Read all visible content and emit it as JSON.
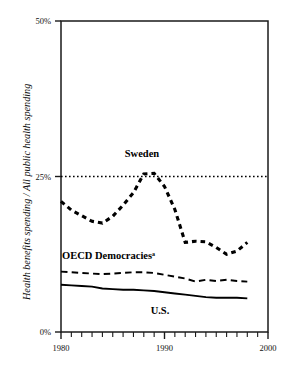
{
  "chart_data": {
    "type": "line",
    "title": "",
    "subtitle": "",
    "xlabel": "",
    "ylabel": "Health benefits spending / All public health spending",
    "xlim": [
      1980,
      2000
    ],
    "ylim": [
      0,
      50
    ],
    "ytick_labels": [
      "0%",
      "25%",
      "50%"
    ],
    "ytick_values": [
      0,
      25,
      50
    ],
    "xtick_labels": [
      "1980",
      "1990",
      "2000"
    ],
    "xtick_values": [
      1980,
      1990,
      2000
    ],
    "xtick_minor_step": 1,
    "grid": false,
    "legend_position": "inline-annotations",
    "reference_lines": [
      {
        "name": "twenty-five-percent-line",
        "y": 25,
        "style": "dotted"
      }
    ],
    "annotations": [
      {
        "name": "sweden-label",
        "text": "Sweden",
        "x": 1988.0,
        "y": 29.5
      },
      {
        "name": "oecd-label",
        "text": "OECD Democracies",
        "superscript": "a",
        "x": 1985.0,
        "y": 12.9
      },
      {
        "name": "us-label",
        "text": "U.S.",
        "x": 1991.5,
        "y": 3.3
      }
    ],
    "series": [
      {
        "name": "Sweden",
        "style": "heavy-dashed",
        "x": [
          1980,
          1981,
          1982,
          1983,
          1984,
          1985,
          1986,
          1987,
          1988,
          1989,
          1990,
          1991,
          1992,
          1993,
          1994,
          1995,
          1996,
          1997,
          1998
        ],
        "values": [
          21.0,
          19.6,
          18.7,
          17.8,
          17.5,
          18.6,
          20.4,
          22.4,
          25.4,
          25.5,
          23.4,
          19.7,
          14.4,
          14.6,
          14.5,
          13.6,
          12.5,
          13.0,
          14.4
        ]
      },
      {
        "name": "OECD Democracies",
        "style": "medium-dashed",
        "x": [
          1980,
          1981,
          1982,
          1983,
          1984,
          1985,
          1986,
          1987,
          1988,
          1989,
          1990,
          1991,
          1992,
          1993,
          1994,
          1995,
          1996,
          1997,
          1998
        ],
        "values": [
          9.7,
          9.6,
          9.5,
          9.4,
          9.3,
          9.4,
          9.5,
          9.6,
          9.6,
          9.5,
          9.2,
          8.9,
          8.6,
          8.1,
          8.4,
          8.2,
          8.4,
          8.2,
          8.1
        ]
      },
      {
        "name": "U.S.",
        "style": "solid",
        "x": [
          1980,
          1981,
          1982,
          1983,
          1984,
          1985,
          1986,
          1987,
          1988,
          1989,
          1990,
          1991,
          1992,
          1993,
          1994,
          1995,
          1996,
          1997,
          1998
        ],
        "values": [
          7.6,
          7.5,
          7.4,
          7.3,
          7.0,
          6.9,
          6.8,
          6.8,
          6.7,
          6.6,
          6.4,
          6.2,
          6.0,
          5.8,
          5.6,
          5.5,
          5.5,
          5.5,
          5.4
        ]
      }
    ]
  },
  "axes": {
    "y_label": "Health benefits spending / All public health spending",
    "y_ticks": [
      "50%",
      "25%",
      "0%"
    ],
    "x_ticks": [
      "1980",
      "1990",
      "2000"
    ]
  },
  "labels": {
    "sweden": "Sweden",
    "oecd": "OECD Democracies",
    "oecd_superscript": "a",
    "us": "U.S."
  },
  "colors": {
    "ink": "#000000",
    "background": "#ffffff"
  }
}
